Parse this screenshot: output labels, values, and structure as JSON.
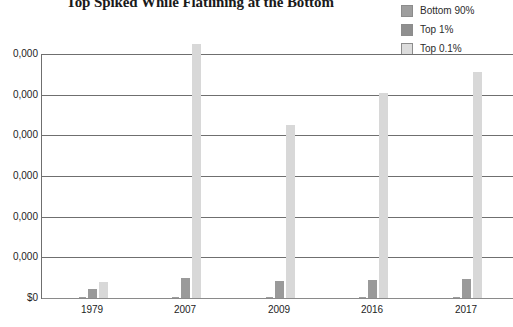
{
  "chart_data": {
    "type": "bar",
    "title": "Top Spiked While Flatlining at the Bottom",
    "xlabel": "",
    "ylabel": "",
    "categories": [
      "1979",
      "2007",
      "2009",
      "2016",
      "2017"
    ],
    "series": [
      {
        "name": "Bottom 90%",
        "color": "#9e9e9e",
        "values": [
          1000,
          1500,
          1200,
          1800,
          2000
        ]
      },
      {
        "name": "Top 1%",
        "color": "#9a9a9a",
        "values": [
          22000,
          48000,
          42000,
          45000,
          47000
        ]
      },
      {
        "name": "Top 0.1%",
        "color": "#d8d8d8",
        "values": [
          40000,
          625000,
          425000,
          505000,
          555000
        ]
      }
    ],
    "ylim": [
      0,
      600000
    ],
    "yticks": [
      0,
      100000,
      200000,
      300000,
      400000,
      500000,
      600000
    ],
    "ytick_labels": [
      "$0",
      "0,000",
      "0,000",
      "0,000",
      "0,000",
      "0,000",
      "0,000"
    ],
    "grid": true,
    "legend_position": "top-right"
  },
  "legend": {
    "entries": [
      {
        "label": "Bottom 90%"
      },
      {
        "label": "Top 1%"
      },
      {
        "label": "Top 0.1%"
      }
    ]
  }
}
